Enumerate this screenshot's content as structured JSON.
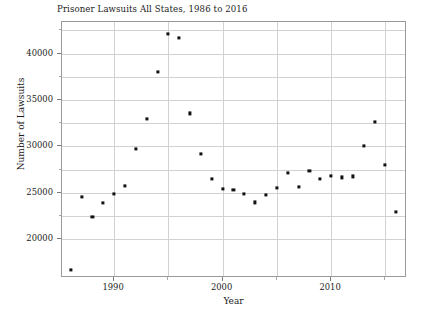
{
  "chart_data": {
    "type": "scatter",
    "title": "Prisoner Lawsuits All States, 1986 to 2016",
    "xlabel": "Year",
    "ylabel": "Number of Lawsuits",
    "xlim": [
      1985.2,
      1017.0
    ],
    "x_range": [
      1985.2,
      2017.0
    ],
    "ylim": [
      15800,
      43400
    ],
    "grid": true,
    "legend": null,
    "xticks": [
      1990,
      2000,
      2010
    ],
    "xtick_labels": [
      "1990",
      "2000",
      "2010"
    ],
    "xticks_minor": [
      1995,
      2005,
      2015
    ],
    "yticks": [
      20000,
      25000,
      30000,
      35000,
      40000
    ],
    "ytick_labels": [
      "20000",
      "25000",
      "30000",
      "35000",
      "40000"
    ],
    "yticks_minor": [
      22500,
      27500,
      32500,
      37500,
      42500
    ],
    "marker": "square",
    "marker_color": "#111111",
    "x": [
      1986,
      1987,
      1988,
      1989,
      1990,
      1991,
      1992,
      1993,
      1994,
      1995,
      1996,
      1997,
      1998,
      1999,
      2000,
      2001,
      2002,
      2003,
      2004,
      2005,
      2006,
      2007,
      2008,
      2009,
      2010,
      2011,
      2012,
      2013,
      2014,
      2015,
      2016
    ],
    "y": [
      16650,
      24550,
      22350,
      23900,
      24900,
      25700,
      29750,
      32950,
      38000,
      42150,
      41700,
      33550,
      29150,
      26450,
      25400,
      25300,
      24850,
      23950,
      24750,
      25550,
      27150,
      25600,
      27350,
      26450,
      26850,
      26650,
      26750,
      30050,
      32600,
      28000,
      22900
    ]
  }
}
